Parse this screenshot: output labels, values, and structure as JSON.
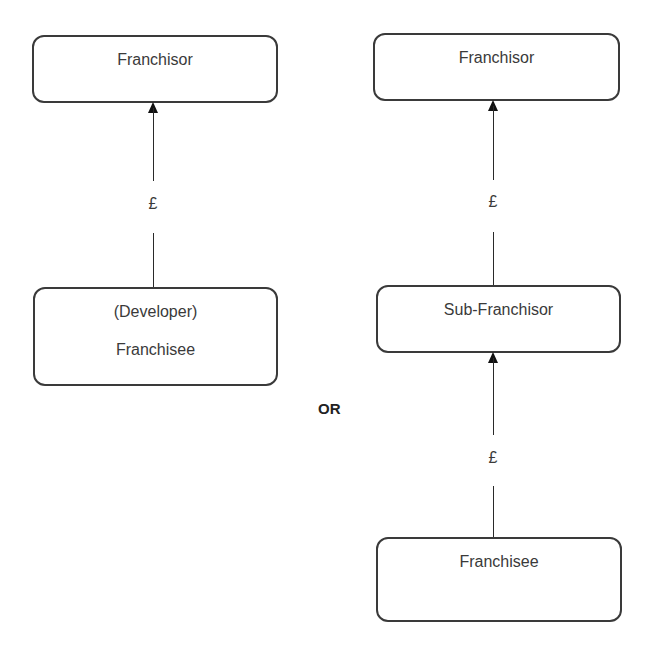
{
  "diagram": {
    "type": "flow",
    "separator_label": "OR",
    "left_structure": {
      "nodes": [
        {
          "id": "franchisor",
          "lines": [
            "Franchisor"
          ]
        },
        {
          "id": "developer_franchisee",
          "lines": [
            "(Developer)",
            "Franchisee"
          ]
        }
      ],
      "edges": [
        {
          "from": "developer_franchisee",
          "to": "franchisor",
          "label": "£"
        }
      ]
    },
    "right_structure": {
      "nodes": [
        {
          "id": "franchisor",
          "lines": [
            "Franchisor"
          ]
        },
        {
          "id": "sub_franchisor",
          "lines": [
            "Sub-Franchisor"
          ]
        },
        {
          "id": "franchisee",
          "lines": [
            "Franchisee"
          ]
        }
      ],
      "edges": [
        {
          "from": "sub_franchisor",
          "to": "franchisor",
          "label": "£"
        },
        {
          "from": "franchisee",
          "to": "sub_franchisor",
          "label": "£"
        }
      ]
    }
  }
}
